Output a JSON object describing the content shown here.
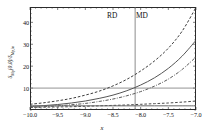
{
  "chart_data": {
    "type": "line",
    "title": "",
    "xlabel": "x",
    "ylabel": "δMp(0,0)/δMp,in",
    "xlim": [
      -10.0,
      -7.0
    ],
    "ylim": [
      0,
      47
    ],
    "grid": false,
    "legend_position": "none",
    "xticks": [
      -10.0,
      -9.5,
      -9.0,
      -8.5,
      -8.0,
      -7.5,
      -7.0
    ],
    "xticklabels": [
      "-10.0",
      "-9.5",
      "-9.0",
      "-8.5",
      "-8.0",
      "-7.5",
      "-7.0"
    ],
    "yticks": [
      10,
      20,
      30,
      40
    ],
    "yticklabels": [
      "10",
      "20",
      "30",
      "40"
    ],
    "x": [
      -10.0,
      -9.75,
      -9.5,
      -9.25,
      -9.0,
      -8.75,
      -8.5,
      -8.25,
      -8.0,
      -7.75,
      -7.5,
      -7.25,
      -7.0
    ],
    "series": [
      {
        "name": "upper-dashed",
        "style": "dashed",
        "color": "#3d3d3d",
        "values": [
          2.6,
          3.3,
          4.2,
          5.3,
          6.8,
          8.6,
          11.0,
          14.0,
          17.8,
          22.4,
          28.2,
          36.0,
          46.8
        ]
      },
      {
        "name": "middle-solid",
        "style": "solid",
        "color": "#555555",
        "values": [
          1.6,
          2.0,
          2.5,
          3.2,
          4.1,
          5.3,
          6.8,
          8.8,
          11.4,
          14.7,
          19.0,
          24.6,
          31.8
        ]
      },
      {
        "name": "lower-dashdot",
        "style": "dashdot",
        "color": "#5a5a5a",
        "values": [
          1.2,
          1.5,
          1.9,
          2.4,
          3.0,
          3.9,
          5.0,
          6.5,
          8.4,
          10.9,
          14.1,
          18.5,
          24.2
        ]
      },
      {
        "name": "flat-dashed",
        "style": "dashed",
        "color": "#4a4a4a",
        "values": [
          1.2,
          1.3,
          1.4,
          1.5,
          1.7,
          1.9,
          2.1,
          2.3,
          2.6,
          2.9,
          3.2,
          3.6,
          4.1
        ]
      },
      {
        "name": "flat-solid",
        "style": "solid",
        "color": "#666666",
        "values": [
          1.9,
          1.9,
          1.9,
          1.9,
          1.9,
          1.9,
          1.9,
          1.9,
          1.9,
          1.9,
          1.9,
          1.9,
          1.9
        ]
      }
    ],
    "annotations": {
      "horizontal_reference_line": {
        "y": 10,
        "color": "#777777"
      },
      "vertical_divider_line": {
        "x": -8.1,
        "color": "#6f6f6f"
      },
      "region_left_label": "RD",
      "region_right_label": "MD"
    }
  }
}
